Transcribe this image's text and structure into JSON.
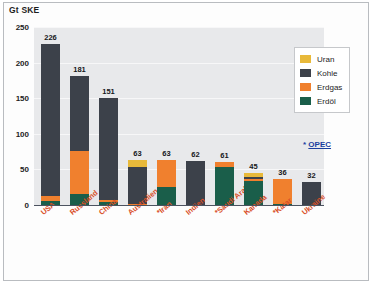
{
  "figure": {
    "axis_title": "Gt SKE",
    "opec_note_marker": "*",
    "opec_note_text": "OPEC"
  },
  "colors": {
    "uran": "#e8b93a",
    "kohle": "#3c414a",
    "erdgas": "#f0802e",
    "erdoel": "#1a5e4a",
    "plot_background": "#e8e9eb",
    "label_text": "#d94f28",
    "note_text": "#1b3fa0"
  },
  "legend": {
    "position": "top-right",
    "items": [
      {
        "label": "Uran",
        "color_key": "uran"
      },
      {
        "label": "Kohle",
        "color_key": "kohle"
      },
      {
        "label": "Erdgas",
        "color_key": "erdgas"
      },
      {
        "label": "Erdöl",
        "color_key": "erdoel"
      }
    ]
  },
  "chart_data": {
    "type": "bar",
    "subtype": "stacked-bar",
    "title": "",
    "xlabel": "",
    "ylabel": "Gt SKE",
    "ylim": [
      0,
      250
    ],
    "yticks": [
      250,
      200,
      150,
      100,
      50,
      0
    ],
    "grid": true,
    "legend_position": "top-right",
    "categories": [
      "USA",
      "Russland",
      "China",
      "Australien",
      "*Iran",
      "Indien",
      "*Saudi Arabien",
      "Kanada",
      "*Katar",
      "Ukraine"
    ],
    "totals": [
      226,
      181,
      151,
      63,
      63,
      62,
      61,
      45,
      36,
      32
    ],
    "series": [
      {
        "name": "Erdöl",
        "color_key": "erdoel",
        "values": [
          6,
          16,
          4,
          0,
          25,
          0,
          53,
          34,
          2,
          0
        ]
      },
      {
        "name": "Erdgas",
        "color_key": "erdgas",
        "values": [
          7,
          60,
          3,
          1,
          38,
          0,
          8,
          2,
          34,
          0
        ]
      },
      {
        "name": "Kohle",
        "color_key": "kohle",
        "values": [
          213,
          105,
          144,
          52,
          0,
          62,
          0,
          3,
          0,
          32
        ]
      },
      {
        "name": "Uran",
        "color_key": "uran",
        "values": [
          0,
          0,
          0,
          10,
          0,
          0,
          0,
          6,
          0,
          0
        ]
      }
    ],
    "annotations": [
      {
        "text": "* OPEC",
        "position": "right"
      }
    ]
  }
}
